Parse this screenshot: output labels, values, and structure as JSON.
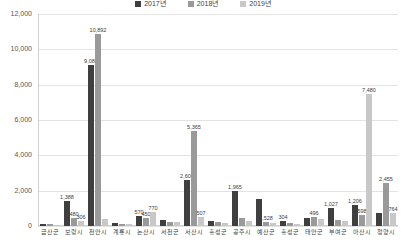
{
  "chart_data": {
    "type": "bar",
    "title": "",
    "xlabel": "",
    "ylabel": "",
    "ylim": [
      0,
      12000
    ],
    "ytick_values": [
      0,
      2000,
      4000,
      6000,
      8000,
      10000,
      12000
    ],
    "ytick_labels": [
      "0",
      "2,000",
      "4,000",
      "6,000",
      "8,000",
      "10,000",
      "12,000"
    ],
    "grid": true,
    "legend_position": "top-center",
    "categories": [
      "금산군",
      "보령시",
      "천안시",
      "계룡시",
      "논산시",
      "서천군",
      "서산시",
      "홍성군",
      "공주시",
      "예산군",
      "홍성군",
      "태안군",
      "부여군",
      "아산시",
      "청양시"
    ],
    "series": [
      {
        "name": "2017년",
        "color": "#3f3f3f",
        "values": [
          120,
          1388,
          9086,
          170,
          570,
          330,
          2608,
          260,
          1965,
          1528,
          304,
          430,
          1027,
          1206,
          760
        ]
      },
      {
        "name": "2018년",
        "color": "#9a9a9a",
        "values": [
          95,
          480,
          10892,
          140,
          450,
          250,
          5365,
          200,
          430,
          220,
          180,
          496,
          340,
          598,
          2455
        ]
      },
      {
        "name": "2019년",
        "color": "#c8c8c8",
        "values": [
          80,
          306,
          420,
          110,
          770,
          200,
          507,
          150,
          310,
          180,
          140,
          398,
          260,
          7480,
          764
        ]
      }
    ],
    "labels": [
      {
        "text": "1,388",
        "series": 0,
        "category": 1
      },
      {
        "text": "480",
        "series": 1,
        "category": 1
      },
      {
        "text": "306",
        "series": 2,
        "category": 1
      },
      {
        "text": "9,086",
        "series": 0,
        "category": 2
      },
      {
        "text": "10,892",
        "series": 1,
        "category": 2
      },
      {
        "text": "570",
        "series": 0,
        "category": 4
      },
      {
        "text": "450",
        "series": 1,
        "category": 4
      },
      {
        "text": "770",
        "series": 2,
        "category": 4
      },
      {
        "text": "2,608",
        "series": 0,
        "category": 6
      },
      {
        "text": "5,365",
        "series": 1,
        "category": 6
      },
      {
        "text": "507",
        "series": 2,
        "category": 6
      },
      {
        "text": "1,965",
        "series": 0,
        "category": 8
      },
      {
        "text": "1,528",
        "series": 1,
        "category": 9
      },
      {
        "text": "304",
        "series": 0,
        "category": 10
      },
      {
        "text": "496",
        "series": 1,
        "category": 11
      },
      {
        "text": "1,027",
        "series": 0,
        "category": 12
      },
      {
        "text": "7,480",
        "series": 2,
        "category": 13
      },
      {
        "text": "1,206",
        "series": 0,
        "category": 13
      },
      {
        "text": "598",
        "series": 1,
        "category": 13
      },
      {
        "text": "2,455",
        "series": 1,
        "category": 14
      },
      {
        "text": "764",
        "series": 2,
        "category": 14
      }
    ]
  }
}
